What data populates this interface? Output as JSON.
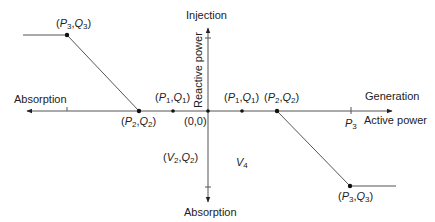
{
  "diagram": {
    "type": "piecewise-linear reactive power vs active power characteristic",
    "axes": {
      "horizontal": {
        "label": "Active power",
        "positive_direction_label": "Generation",
        "negative_direction_label": "Absorption",
        "tick_label": "P",
        "tick_label_sub": "3"
      },
      "vertical": {
        "label": "Reactive power",
        "positive_direction_label": "Injection",
        "negative_direction_label": "Absorption"
      },
      "origin_label": "(0,0)"
    },
    "points": {
      "left_p3q3": {
        "p": "P",
        "ps": "3",
        "q": "Q",
        "qs": "3"
      },
      "left_p2q2": {
        "p": "P",
        "ps": "2",
        "q": "Q",
        "qs": "2"
      },
      "left_p1q1": {
        "p": "P",
        "ps": "1",
        "q": "Q",
        "qs": "1"
      },
      "right_p1q1": {
        "p": "P",
        "ps": "1",
        "q": "Q",
        "qs": "1"
      },
      "right_p2q2": {
        "p": "P",
        "ps": "2",
        "q": "Q",
        "qs": "2"
      },
      "right_p3q3": {
        "p": "P",
        "ps": "3",
        "q": "Q",
        "qs": "3"
      },
      "v2q2": {
        "p": "V",
        "ps": "2",
        "q": "Q",
        "qs": "2"
      }
    },
    "region_label": {
      "text": "V",
      "sub": "4"
    },
    "colors": {
      "line": "#555555",
      "axis": "#333333",
      "text": "#222222",
      "background": "#ffffff"
    }
  }
}
